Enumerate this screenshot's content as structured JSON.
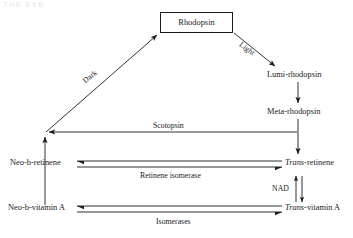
{
  "page": {
    "background_color": "#ffffff",
    "ink_color": "#1a1a1a",
    "header_fragment": "THE EYE"
  },
  "diagram": {
    "type": "flow-cycle",
    "nodes": [
      {
        "id": "rhodopsin",
        "label": "Rhodopsin",
        "shape": "box",
        "italic_prefix": ""
      },
      {
        "id": "lumi-rhodopsin",
        "label": "Lumi-rhodopsin",
        "shape": "text",
        "italic_prefix": ""
      },
      {
        "id": "meta-rhodopsin",
        "label": "Meta-rhodopsin",
        "shape": "text",
        "italic_prefix": ""
      },
      {
        "id": "trans-retinene",
        "label": "-retinene",
        "shape": "text",
        "italic_prefix": "Trans"
      },
      {
        "id": "trans-vitamin-a",
        "label": "-vitamin A",
        "shape": "text",
        "italic_prefix": "Trans"
      },
      {
        "id": "neo-b-retinene",
        "label": "Neo-b-retinene",
        "shape": "text",
        "italic_prefix": ""
      },
      {
        "id": "neo-b-vitamin-a",
        "label": "Neo-b-vitamin A",
        "shape": "text",
        "italic_prefix": ""
      }
    ],
    "edges": [
      {
        "id": "light",
        "label": "Light",
        "from": "rhodopsin",
        "to": "lumi-rhodopsin"
      },
      {
        "id": "lumi-to-meta",
        "label": "",
        "from": "lumi-rhodopsin",
        "to": "meta-rhodopsin"
      },
      {
        "id": "meta-to-trans-retinene",
        "label": "",
        "from": "meta-rhodopsin",
        "to": "trans-retinene"
      },
      {
        "id": "scotopsin",
        "label": "Scotopsin",
        "from": "meta-rhodopsin",
        "to": "junction"
      },
      {
        "id": "retinene-isomerase",
        "label": "Retinene isomerase",
        "from": "trans-retinene",
        "to": "neo-b-retinene"
      },
      {
        "id": "nad",
        "label": "NAD",
        "from": "trans-vitamin-a",
        "to": "trans-retinene"
      },
      {
        "id": "isomerases",
        "label": "Isomerases",
        "from": "trans-vitamin-a",
        "to": "neo-b-vitamin-a"
      },
      {
        "id": "neo-vitamin-to-neo-retinene",
        "label": "",
        "from": "neo-b-vitamin-a",
        "to": "neo-b-retinene"
      },
      {
        "id": "dark",
        "label": "Dark",
        "from": "junction",
        "to": "rhodopsin"
      }
    ]
  }
}
